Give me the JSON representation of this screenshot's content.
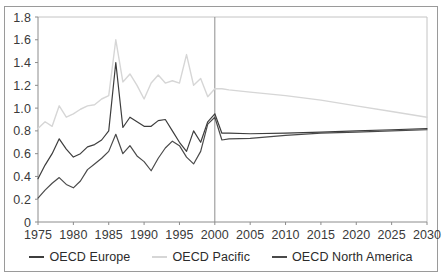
{
  "chart_data": {
    "type": "line",
    "title": "",
    "subtitle": "",
    "xlabel": "",
    "ylabel": "",
    "xlim": [
      1975,
      2030
    ],
    "ylim": [
      0,
      1.8
    ],
    "grid": false,
    "legend_position": "bottom",
    "xticks": [
      1975,
      1980,
      1985,
      1990,
      1995,
      2000,
      2005,
      2010,
      2015,
      2020,
      2025,
      2030
    ],
    "xtick_labels": [
      "1975",
      "1980",
      "1985",
      "1990",
      "1995",
      "2000",
      "2005",
      "2010",
      "2015",
      "2020",
      "2025",
      "2030"
    ],
    "yticks": [
      0,
      0.2,
      0.4,
      0.6,
      0.8,
      1.0,
      1.2,
      1.4,
      1.6,
      1.8
    ],
    "ytick_labels": [
      "0",
      "0.2",
      "0.4",
      "0.6",
      "0.8",
      "1.0",
      "1.2",
      "1.4",
      "1.6",
      "1.8"
    ],
    "annotations": [
      {
        "name": "projection-divider",
        "type": "vline",
        "x": 2000
      }
    ],
    "colors": {
      "oecd_europe": "#3d3d3d",
      "oecd_pacific": "#d6d6d6",
      "oecd_north_america": "#4a4a4a",
      "axis": "#8c8c8c",
      "frame": "#9a9a9a",
      "text": "#3a3a3a"
    },
    "x": [
      1975,
      1976,
      1977,
      1978,
      1979,
      1980,
      1981,
      1982,
      1983,
      1984,
      1985,
      1986,
      1987,
      1988,
      1989,
      1990,
      1991,
      1992,
      1993,
      1994,
      1995,
      1996,
      1997,
      1998,
      1999,
      2000,
      2001,
      2002,
      2005,
      2010,
      2015,
      2020,
      2025,
      2030
    ],
    "series": [
      {
        "name": "OECD Europe",
        "color": "#3d3d3d",
        "values": [
          0.38,
          0.5,
          0.6,
          0.73,
          0.64,
          0.57,
          0.6,
          0.66,
          0.68,
          0.72,
          0.8,
          1.4,
          0.83,
          0.92,
          0.88,
          0.84,
          0.84,
          0.89,
          0.9,
          0.8,
          0.7,
          0.62,
          0.8,
          0.7,
          0.88,
          0.95,
          0.78,
          0.78,
          0.775,
          0.78,
          0.79,
          0.8,
          0.81,
          0.82
        ]
      },
      {
        "name": "OECD Pacific",
        "color": "#d6d6d6",
        "values": [
          0.82,
          0.88,
          0.84,
          1.02,
          0.92,
          0.95,
          0.99,
          1.02,
          1.03,
          1.08,
          1.11,
          1.6,
          1.23,
          1.3,
          1.2,
          1.08,
          1.22,
          1.29,
          1.22,
          1.24,
          1.22,
          1.47,
          1.2,
          1.26,
          1.1,
          1.17,
          1.17,
          1.16,
          1.14,
          1.11,
          1.07,
          1.02,
          0.97,
          0.92
        ]
      },
      {
        "name": "OECD North America",
        "color": "#4a4a4a",
        "values": [
          0.21,
          0.28,
          0.34,
          0.39,
          0.33,
          0.3,
          0.36,
          0.46,
          0.51,
          0.56,
          0.62,
          0.77,
          0.6,
          0.67,
          0.58,
          0.53,
          0.45,
          0.56,
          0.65,
          0.71,
          0.67,
          0.57,
          0.51,
          0.62,
          0.86,
          0.92,
          0.72,
          0.73,
          0.735,
          0.76,
          0.78,
          0.79,
          0.8,
          0.81
        ]
      }
    ]
  },
  "legend": {
    "items": [
      {
        "label": "OECD Europe",
        "color": "#3d3d3d"
      },
      {
        "label": "OECD Pacific",
        "color": "#d6d6d6"
      },
      {
        "label": "OECD North America",
        "color": "#4a4a4a"
      }
    ]
  }
}
